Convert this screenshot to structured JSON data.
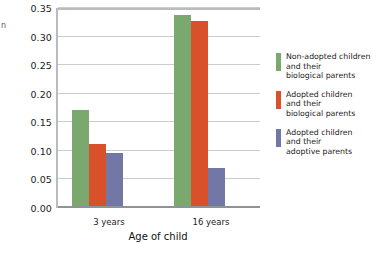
{
  "chart_data": {
    "type": "bar",
    "title": "",
    "subtitle": "",
    "xlabel": "Age of child",
    "ylabel": "",
    "categories": [
      "3 years",
      "16 years"
    ],
    "series": [
      {
        "name": "Non-adopted children and their biological parents",
        "color": "#7aa86f",
        "values": [
          0.172,
          0.338
        ]
      },
      {
        "name": "Adopted children and their biological parents",
        "color": "#d8512a",
        "values": [
          0.112,
          0.328
        ]
      },
      {
        "name": "Adopted children and their adoptive parents",
        "color": "#7277a6",
        "values": [
          0.096,
          0.07
        ]
      }
    ],
    "ylim": [
      0.0,
      0.35
    ],
    "ytick_labels": [
      "0.35",
      "0.30",
      "0.25",
      "0.20",
      "0.15",
      "0.10",
      "0.05",
      "0.00"
    ],
    "ytick_values": [
      0.35,
      0.3,
      0.25,
      0.2,
      0.15,
      0.1,
      0.05,
      0.0
    ],
    "grid": true,
    "legend_position": "right",
    "legend": [
      {
        "label": "Non-adopted children\nand their\nbiological parents",
        "color": "#7aa86f"
      },
      {
        "label": "Adopted children\nand their\nbiological parents",
        "color": "#d8512a"
      },
      {
        "label": "Adopted children\nand  their\nadoptive parents",
        "color": "#7277a6"
      }
    ]
  },
  "axis": {
    "x_title": "Age of child",
    "y_title_clipped": "n"
  },
  "colors": {
    "grid": "#c9ccce",
    "axis": "#b9bcbe",
    "baseline": "#8f9396",
    "text": "#1c1c1c",
    "background": "#ffffff"
  }
}
